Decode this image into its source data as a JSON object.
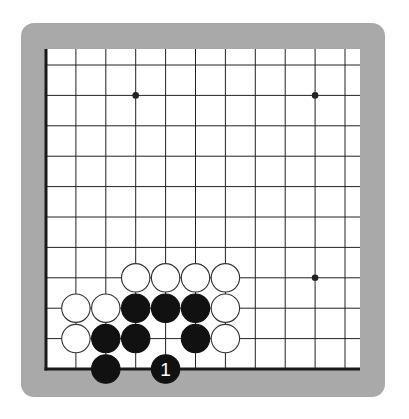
{
  "board": {
    "frame_color": "#a9a9a9",
    "paper_color": "#ffffff",
    "line_color": "#222222",
    "edge_color": "#1a1a1a",
    "stone_black": "#111111",
    "stone_white": "#ffffff",
    "stone_outline": "#333333",
    "origin_x": 46,
    "origin_y": 65,
    "col_spacing": 29.9,
    "row_spacing": 30.4,
    "cols": 11,
    "rows": 11,
    "paper_left": 46,
    "paper_top": 49,
    "paper_right": 360,
    "paper_bottom": 369,
    "edges": [
      "left",
      "bottom"
    ],
    "stone_radius": 14.2,
    "star_points": [
      {
        "col": 3,
        "row": 1
      },
      {
        "col": 9,
        "row": 1
      },
      {
        "col": 9,
        "row": 7
      }
    ],
    "stones": [
      {
        "col": 3,
        "row": 7,
        "color": "white"
      },
      {
        "col": 4,
        "row": 7,
        "color": "white"
      },
      {
        "col": 5,
        "row": 7,
        "color": "white"
      },
      {
        "col": 6,
        "row": 7,
        "color": "white"
      },
      {
        "col": 1,
        "row": 8,
        "color": "white"
      },
      {
        "col": 2,
        "row": 8,
        "color": "white"
      },
      {
        "col": 3,
        "row": 8,
        "color": "black"
      },
      {
        "col": 4,
        "row": 8,
        "color": "black"
      },
      {
        "col": 5,
        "row": 8,
        "color": "black"
      },
      {
        "col": 6,
        "row": 8,
        "color": "white"
      },
      {
        "col": 1,
        "row": 9,
        "color": "white"
      },
      {
        "col": 2,
        "row": 9,
        "color": "black"
      },
      {
        "col": 3,
        "row": 9,
        "color": "black"
      },
      {
        "col": 5,
        "row": 9,
        "color": "black"
      },
      {
        "col": 6,
        "row": 9,
        "color": "white"
      },
      {
        "col": 2,
        "row": 10,
        "color": "black"
      },
      {
        "col": 4,
        "row": 10,
        "color": "black",
        "label": "1"
      }
    ]
  }
}
